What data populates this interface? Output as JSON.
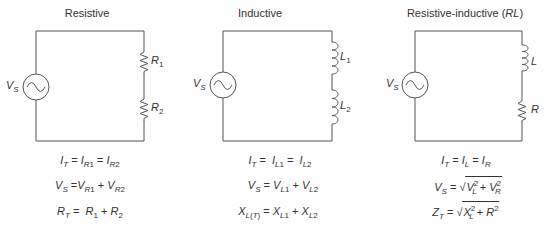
{
  "panels": [
    {
      "title": "Resistive",
      "source_label": "V",
      "source_sub": "S",
      "components": [
        {
          "type": "resistor",
          "label": "R",
          "sub": "1"
        },
        {
          "type": "resistor",
          "label": "R",
          "sub": "2"
        }
      ],
      "equations": [
        "I_T = I_R1 = I_R2",
        "V_S = V_R1 + V_R2",
        "R_T = R_1 + R_2"
      ]
    },
    {
      "title": "Inductive",
      "source_label": "V",
      "source_sub": "S",
      "components": [
        {
          "type": "inductor",
          "label": "L",
          "sub": "1"
        },
        {
          "type": "inductor",
          "label": "L",
          "sub": "2"
        }
      ],
      "equations": [
        "I_T = I_L1 = I_L2",
        "V_S = V_L1 + V_L2",
        "X_L(T) = X_L1 + X_L2"
      ]
    },
    {
      "title": "Resistive-inductive (",
      "title_italic": "RL",
      "title_end": ")",
      "source_label": "V",
      "source_sub": "S",
      "components": [
        {
          "type": "inductor",
          "label": "L",
          "sub": ""
        },
        {
          "type": "resistor",
          "label": "R",
          "sub": ""
        }
      ],
      "equations": [
        "I_T = I_L = I_R",
        "V_S = sqrt(V_L^2 + V_R^2)",
        "Z_T = sqrt(X_L^2 + R^2)"
      ]
    }
  ],
  "colors": {
    "line": "#555555",
    "text": "#333333",
    "background": "#ffffff"
  }
}
